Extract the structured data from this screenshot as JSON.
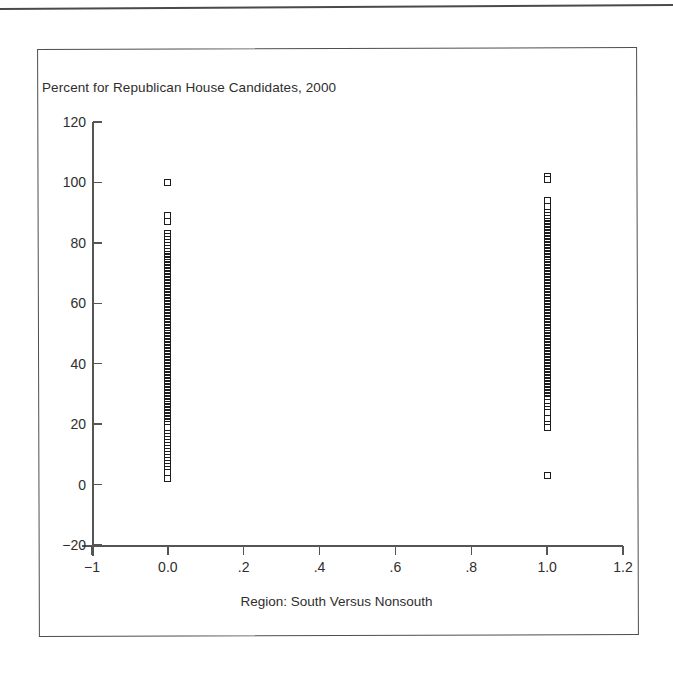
{
  "figure": {
    "title": "Percent for Republican House Candidates, 2000",
    "x_axis_title": "Region: South Versus Nonsouth"
  },
  "chart_data": {
    "type": "scatter",
    "title": "Percent for Republican House Candidates, 2000",
    "xlabel": "Region: South Versus Nonsouth",
    "ylabel": "Percent for Republican House Candidates, 2000",
    "xlim": [
      -0.2,
      1.2
    ],
    "ylim": [
      -20,
      120
    ],
    "grid": false,
    "legend": null,
    "x_ticks": [
      -0.2,
      0.0,
      0.2,
      0.4,
      0.6,
      0.8,
      1.0,
      1.2
    ],
    "x_tick_labels": [
      "-1",
      "0.0",
      ".2",
      ".4",
      ".6",
      ".8",
      "1.0",
      "1.2"
    ],
    "y_ticks": [
      -20,
      0,
      20,
      40,
      60,
      80,
      100,
      120
    ],
    "y_tick_labels": [
      "-20",
      "0",
      "20",
      "40",
      "60",
      "80",
      "100",
      "120"
    ],
    "marker": "open-square",
    "series": [
      {
        "name": "Nonsouth",
        "x": 0.0,
        "values": [
          100,
          89,
          87,
          83,
          82,
          81,
          80,
          79,
          78,
          77,
          76,
          75.5,
          75,
          74.5,
          74,
          73.5,
          73,
          72.5,
          72,
          71.5,
          71,
          70.5,
          70,
          69.5,
          69,
          68.5,
          68,
          67.5,
          67,
          66.5,
          66,
          65.5,
          65,
          64.5,
          64,
          63.5,
          63,
          62.5,
          62,
          61.5,
          61,
          60.5,
          60,
          59.5,
          59,
          58.5,
          58,
          57.5,
          57,
          56.5,
          56,
          55.5,
          55,
          54.5,
          54,
          53.5,
          53,
          52.5,
          52,
          51.5,
          51,
          50.5,
          50,
          49.5,
          49,
          48.5,
          48,
          47.5,
          47,
          46.5,
          46,
          45.5,
          45,
          44.5,
          44,
          43.5,
          43,
          42.5,
          42,
          41.5,
          41,
          40.5,
          40,
          39.5,
          39,
          38.5,
          38,
          37.5,
          37,
          36.5,
          36,
          35.5,
          35,
          34.5,
          34,
          33.5,
          33,
          32.5,
          32,
          31.5,
          31,
          30.5,
          30,
          29.5,
          29,
          28.5,
          28,
          27.5,
          27,
          26.5,
          26,
          25.5,
          25,
          24.5,
          24,
          23.5,
          23,
          22.5,
          22,
          21.5,
          21,
          20.5,
          20,
          19,
          17,
          16,
          15,
          14,
          13,
          12,
          11,
          10,
          9,
          8,
          7,
          6,
          5,
          4,
          2
        ]
      },
      {
        "name": "South",
        "x": 1.0,
        "values": [
          102,
          101,
          94,
          92,
          90,
          89,
          88,
          87,
          86.5,
          86,
          85.5,
          85,
          84.5,
          84,
          83.5,
          83,
          82.5,
          82,
          81.5,
          81,
          80.5,
          80,
          79.5,
          79,
          78.5,
          78,
          77.5,
          77,
          76.5,
          76,
          75.5,
          75,
          74.5,
          74,
          73.5,
          73,
          72.5,
          72,
          71.5,
          71,
          70.5,
          70,
          69.5,
          69,
          68.5,
          68,
          67.5,
          67,
          66.5,
          66,
          65.5,
          65,
          64.5,
          64,
          63.5,
          63,
          62.5,
          62,
          61.5,
          61,
          60.5,
          60,
          59.5,
          59,
          58.5,
          58,
          57.5,
          57,
          56.5,
          56,
          55.5,
          55,
          54.5,
          54,
          53.5,
          53,
          52.5,
          52,
          51.5,
          51,
          50.5,
          50,
          49.5,
          49,
          48.5,
          48,
          47.5,
          47,
          46.5,
          46,
          45.5,
          45,
          44.5,
          44,
          43.5,
          43,
          42.5,
          42,
          41.5,
          41,
          40.5,
          40,
          39.5,
          39,
          38.5,
          38,
          37.5,
          37,
          36.5,
          36,
          35.5,
          35,
          34.5,
          34,
          33.5,
          33,
          32.5,
          32,
          31.5,
          31,
          30.5,
          30,
          29.5,
          29,
          28.5,
          28,
          27,
          26,
          25,
          24,
          22,
          20,
          19,
          3
        ]
      }
    ]
  }
}
